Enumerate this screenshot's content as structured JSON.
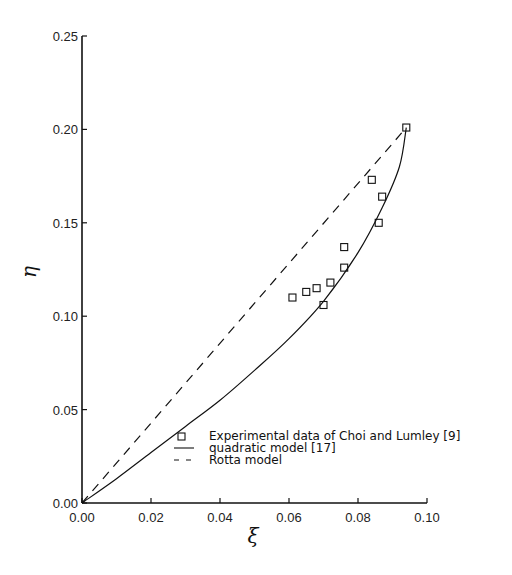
{
  "chart_data": {
    "type": "scatter",
    "title": "",
    "xlabel": "ξ",
    "ylabel": "η",
    "xlim": [
      0.0,
      0.1
    ],
    "ylim": [
      0.0,
      0.25
    ],
    "grid": false,
    "legend_position": "lower right (inside)",
    "x_ticks": [
      "0.00",
      "0.02",
      "0.04",
      "0.06",
      "0.08",
      "0.10"
    ],
    "y_ticks": [
      "0.00",
      "0.05",
      "0.10",
      "0.15",
      "0.20",
      "0.25"
    ],
    "series": [
      {
        "name": "Experimental data of Choi and Lumley [9]",
        "style": "open-square-markers",
        "points": [
          [
            0.094,
            0.201
          ],
          [
            0.084,
            0.173
          ],
          [
            0.087,
            0.164
          ],
          [
            0.086,
            0.15
          ],
          [
            0.076,
            0.137
          ],
          [
            0.076,
            0.126
          ],
          [
            0.072,
            0.118
          ],
          [
            0.068,
            0.115
          ],
          [
            0.065,
            0.113
          ],
          [
            0.061,
            0.11
          ],
          [
            0.07,
            0.106
          ]
        ]
      },
      {
        "name": "quadratic model [17]",
        "style": "solid-line",
        "points": [
          [
            0.0,
            0.0
          ],
          [
            0.01,
            0.013
          ],
          [
            0.02,
            0.027
          ],
          [
            0.03,
            0.041
          ],
          [
            0.04,
            0.055
          ],
          [
            0.05,
            0.071
          ],
          [
            0.06,
            0.088
          ],
          [
            0.07,
            0.108
          ],
          [
            0.08,
            0.134
          ],
          [
            0.087,
            0.158
          ],
          [
            0.092,
            0.18
          ],
          [
            0.094,
            0.201
          ]
        ]
      },
      {
        "name": "Rotta model",
        "style": "dashed-line",
        "points": [
          [
            0.0,
            0.0
          ],
          [
            0.094,
            0.201
          ]
        ]
      }
    ]
  },
  "legend": {
    "items": [
      {
        "label": "Experimental data of Choi and Lumley [9]",
        "symbol": "square"
      },
      {
        "label": "quadratic model [17]",
        "symbol": "solid"
      },
      {
        "label": "Rotta model",
        "symbol": "dashed"
      }
    ]
  },
  "axes": {
    "x_label": "ξ",
    "y_label": "η"
  }
}
